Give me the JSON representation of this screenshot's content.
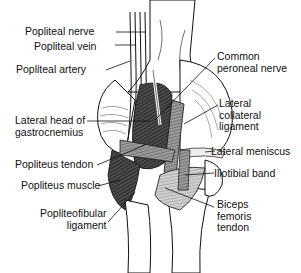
{
  "diagram": {
    "labels_left": [
      {
        "id": "popliteal-nerve",
        "text": "Popliteal nerve"
      },
      {
        "id": "popliteal-vein",
        "text": "Popliteal vein"
      },
      {
        "id": "popliteal-artery",
        "text": "Popliteal artery"
      },
      {
        "id": "lateral-head-gastrocnemius",
        "text": "Lateral head of\ngastrocnemius"
      },
      {
        "id": "popliteus-tendon",
        "text": "Popliteus tendon"
      },
      {
        "id": "popliteus-muscle",
        "text": "Popliteus muscle"
      },
      {
        "id": "popliteofibular-ligament",
        "text": "Popliteofibular\nligament"
      }
    ],
    "labels_right": [
      {
        "id": "common-peroneal-nerve",
        "text": "Common\nperoneal nerve"
      },
      {
        "id": "lateral-collateral-ligament",
        "text": "Lateral\ncollateral\nligament"
      },
      {
        "id": "lateral-meniscus",
        "text": "Lateral meniscus"
      },
      {
        "id": "iliotibial-band",
        "text": "Iliotibial band"
      },
      {
        "id": "biceps-femoris-tendon",
        "text": "Biceps\nfemoris\ntendon"
      }
    ],
    "colors": {
      "line": "#111111",
      "dark_muscle": "#3a3a3a",
      "mid_muscle": "#7a7a7a",
      "light_fill": "#d8d8d8",
      "bone": "#ffffff"
    }
  }
}
